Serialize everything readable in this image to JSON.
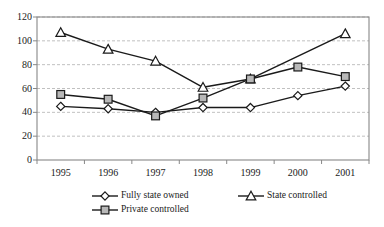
{
  "chart_data": {
    "type": "line",
    "title": "",
    "xlabel": "",
    "ylabel": "",
    "categories": [
      "1995",
      "1996",
      "1997",
      "1998",
      "1999",
      "2000",
      "2001"
    ],
    "ylim": [
      0,
      120
    ],
    "yticks": [
      0,
      20,
      40,
      60,
      80,
      100,
      120
    ],
    "grid": true,
    "legend_position": "bottom",
    "series": [
      {
        "name": "Fully state owned",
        "marker": "diamond",
        "values": [
          45,
          43,
          40,
          44,
          44,
          54,
          62
        ]
      },
      {
        "name": "State controlled",
        "marker": "triangle",
        "values": [
          107,
          93,
          83,
          61,
          68,
          null,
          106
        ]
      },
      {
        "name": "Private controlled",
        "marker": "square",
        "values": [
          55,
          51,
          37,
          52,
          68,
          78,
          70
        ]
      }
    ]
  },
  "axis": {
    "y_tick_labels": [
      "120",
      "100",
      "80",
      "60",
      "40",
      "20",
      "0"
    ],
    "x_tick_labels": [
      "1995",
      "1996",
      "1997",
      "1998",
      "1999",
      "2000",
      "2001"
    ]
  },
  "legend": {
    "items": [
      {
        "label": "Fully state owned",
        "marker": "diamond"
      },
      {
        "label": "State controlled",
        "marker": "triangle"
      },
      {
        "label": "Private controlled",
        "marker": "square"
      }
    ]
  },
  "colors": {
    "line": "#1a1a1a",
    "marker_fill_open": "#ffffff",
    "marker_fill_square": "#b8b8b8",
    "grid": "#b0b0b0",
    "frame": "#888888",
    "text": "#1a1a1a"
  }
}
